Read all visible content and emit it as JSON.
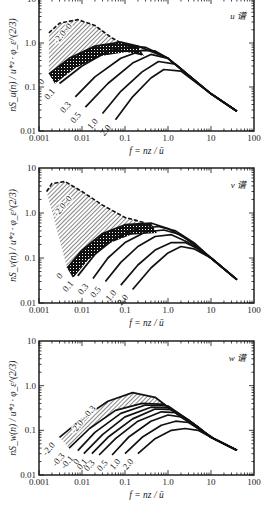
{
  "figure": {
    "x_axis": {
      "label": "f = nz / ū",
      "ticks": [
        "0.001",
        "0.01",
        "0.1",
        "1.0",
        "10",
        "100"
      ],
      "scale": "log",
      "range": [
        0.001,
        100
      ]
    },
    "y_axis": {
      "ticks": [
        "0.01",
        "0.1",
        "1.0",
        "10"
      ],
      "scale": "log",
      "range": [
        0.01,
        10
      ]
    }
  },
  "chart_data": [
    {
      "type": "line",
      "title": "u 谱",
      "xlabel": "f = nz / ū",
      "ylabel": "nS_u(n) / u*² · φ_ε^(2/3)",
      "xlim": [
        0.001,
        100
      ],
      "ylim": [
        0.01,
        10
      ],
      "xscale": "log",
      "yscale": "log",
      "grid": false,
      "annotations": [
        "-2.0~0 (hatched, dashed boundary)",
        "0 (cross-hatched band)"
      ],
      "series": [
        {
          "name": "-2.0~0 upper envelope",
          "style": "dashed",
          "x": [
            0.0017,
            0.003,
            0.008,
            0.02,
            0.05,
            0.1
          ],
          "y": [
            1.7,
            2.8,
            3.4,
            2.5,
            1.3,
            0.9
          ]
        },
        {
          "name": "0",
          "x": [
            0.0017,
            0.005,
            0.02,
            0.08,
            0.2,
            1.0,
            10,
            40
          ],
          "y": [
            0.2,
            0.45,
            0.85,
            1.05,
            0.85,
            0.45,
            0.07,
            0.028
          ]
        },
        {
          "name": "0.1",
          "x": [
            0.003,
            0.01,
            0.04,
            0.15,
            0.3,
            1.0,
            10,
            40
          ],
          "y": [
            0.12,
            0.3,
            0.65,
            0.85,
            0.8,
            0.45,
            0.07,
            0.028
          ]
        },
        {
          "name": "0.3",
          "x": [
            0.007,
            0.02,
            0.08,
            0.25,
            0.5,
            1.0,
            10,
            40
          ],
          "y": [
            0.06,
            0.17,
            0.45,
            0.68,
            0.66,
            0.45,
            0.07,
            0.028
          ]
        },
        {
          "name": "0.5",
          "x": [
            0.012,
            0.04,
            0.15,
            0.4,
            1.0,
            10,
            40
          ],
          "y": [
            0.035,
            0.12,
            0.35,
            0.55,
            0.45,
            0.07,
            0.028
          ]
        },
        {
          "name": "1.0",
          "x": [
            0.03,
            0.08,
            0.25,
            0.6,
            1.5,
            10,
            40
          ],
          "y": [
            0.025,
            0.08,
            0.22,
            0.38,
            0.33,
            0.07,
            0.028
          ]
        },
        {
          "name": "2.0",
          "x": [
            0.06,
            0.15,
            0.4,
            0.8,
            2.0,
            10,
            40
          ],
          "y": [
            0.018,
            0.06,
            0.16,
            0.25,
            0.23,
            0.07,
            0.028
          ]
        }
      ],
      "curve_labels": [
        "-2.0~0",
        "0",
        "0.1",
        "0.3",
        "0.5",
        "1.0",
        "2.0"
      ]
    },
    {
      "type": "line",
      "title": "v 谱",
      "xlabel": "f = nz / ū",
      "ylabel": "nS_v(n) / u*² · φ_ε^(2/3)",
      "xlim": [
        0.001,
        100
      ],
      "ylim": [
        0.01,
        10
      ],
      "xscale": "log",
      "yscale": "log",
      "grid": false,
      "annotations": [
        "-2.0~0 (hatched, dashed boundary)",
        "0 (cross-hatched band)"
      ],
      "series": [
        {
          "name": "-2.0~0 upper envelope",
          "style": "dashed",
          "x": [
            0.0015,
            0.002,
            0.004,
            0.01,
            0.03,
            0.1,
            0.3
          ],
          "y": [
            3.0,
            4.5,
            5.0,
            3.0,
            1.5,
            0.8,
            0.6
          ]
        },
        {
          "name": "0",
          "x": [
            0.0045,
            0.01,
            0.03,
            0.1,
            0.4,
            1.0,
            3.0,
            10,
            40
          ],
          "y": [
            0.06,
            0.15,
            0.35,
            0.55,
            0.6,
            0.45,
            0.25,
            0.1,
            0.033
          ]
        },
        {
          "name": "0.1",
          "x": [
            0.008,
            0.02,
            0.06,
            0.2,
            0.6,
            1.5,
            4.0,
            10,
            40
          ],
          "y": [
            0.04,
            0.12,
            0.28,
            0.45,
            0.5,
            0.4,
            0.22,
            0.1,
            0.033
          ]
        },
        {
          "name": "0.3",
          "x": [
            0.018,
            0.04,
            0.1,
            0.3,
            0.8,
            2.0,
            4.0,
            10,
            40
          ],
          "y": [
            0.035,
            0.1,
            0.22,
            0.38,
            0.42,
            0.33,
            0.2,
            0.1,
            0.033
          ]
        },
        {
          "name": "0.5",
          "x": [
            0.035,
            0.08,
            0.2,
            0.5,
            1.2,
            3.0,
            10,
            40
          ],
          "y": [
            0.03,
            0.08,
            0.18,
            0.3,
            0.33,
            0.22,
            0.1,
            0.033
          ]
        },
        {
          "name": "1.0",
          "x": [
            0.08,
            0.2,
            0.5,
            1.2,
            2.5,
            5.0,
            10,
            40
          ],
          "y": [
            0.025,
            0.07,
            0.15,
            0.22,
            0.22,
            0.16,
            0.1,
            0.033
          ]
        },
        {
          "name": "2.0",
          "x": [
            0.15,
            0.4,
            1.0,
            2.0,
            4.0,
            10,
            40
          ],
          "y": [
            0.02,
            0.06,
            0.13,
            0.18,
            0.16,
            0.1,
            0.033
          ]
        }
      ],
      "curve_labels": [
        "-2.0~0",
        "0",
        "0.1",
        "0.3",
        "0.5",
        "1.0",
        "2.0"
      ]
    },
    {
      "type": "line",
      "title": "w 谱",
      "xlabel": "f = nz / ū",
      "ylabel": "nS_w(n) / u*² · φ_ε^(2/3)",
      "xlim": [
        0.001,
        100
      ],
      "ylim": [
        0.01,
        10
      ],
      "xscale": "log",
      "yscale": "log",
      "grid": false,
      "annotations": [
        "-2.0~-0.3 (hatched band)"
      ],
      "series": [
        {
          "name": "-2.0",
          "x": [
            0.003,
            0.01,
            0.04,
            0.15,
            0.5,
            2.0,
            10,
            40
          ],
          "y": [
            0.07,
            0.18,
            0.45,
            0.7,
            0.55,
            0.2,
            0.07,
            0.036
          ]
        },
        {
          "name": "-0.3",
          "x": [
            0.005,
            0.015,
            0.06,
            0.25,
            0.8,
            3.0,
            10,
            40
          ],
          "y": [
            0.04,
            0.11,
            0.28,
            0.4,
            0.38,
            0.17,
            0.07,
            0.036
          ]
        },
        {
          "name": "-0.1",
          "x": [
            0.008,
            0.02,
            0.08,
            0.3,
            1.0,
            3.0,
            10,
            40
          ],
          "y": [
            0.035,
            0.09,
            0.24,
            0.37,
            0.35,
            0.17,
            0.07,
            0.036
          ]
        },
        {
          "name": "0",
          "x": [
            0.011,
            0.03,
            0.1,
            0.4,
            1.0,
            3.0,
            10,
            40
          ],
          "y": [
            0.03,
            0.08,
            0.2,
            0.33,
            0.32,
            0.16,
            0.07,
            0.036
          ]
        },
        {
          "name": "0.1",
          "x": [
            0.017,
            0.04,
            0.15,
            0.5,
            1.2,
            3.0,
            10,
            40
          ],
          "y": [
            0.03,
            0.07,
            0.18,
            0.3,
            0.29,
            0.16,
            0.07,
            0.036
          ]
        },
        {
          "name": "0.3",
          "x": [
            0.025,
            0.06,
            0.2,
            0.7,
            1.5,
            4.0,
            10,
            40
          ],
          "y": [
            0.028,
            0.065,
            0.16,
            0.26,
            0.25,
            0.14,
            0.07,
            0.036
          ]
        },
        {
          "name": "0.5",
          "x": [
            0.05,
            0.12,
            0.4,
            1.0,
            2.0,
            5.0,
            10,
            40
          ],
          "y": [
            0.028,
            0.07,
            0.16,
            0.22,
            0.2,
            0.12,
            0.07,
            0.036
          ]
        },
        {
          "name": "1.0",
          "x": [
            0.1,
            0.25,
            0.7,
            1.5,
            3.0,
            6.0,
            12,
            40
          ],
          "y": [
            0.03,
            0.07,
            0.13,
            0.16,
            0.15,
            0.1,
            0.065,
            0.036
          ]
        },
        {
          "name": "2.0",
          "x": [
            0.2,
            0.5,
            1.2,
            2.5,
            5.0,
            10,
            40
          ],
          "y": [
            0.03,
            0.065,
            0.1,
            0.11,
            0.1,
            0.07,
            0.036
          ]
        }
      ],
      "curve_labels": [
        "-2.0",
        "-2.0~-0.3",
        "-0.3",
        "-0.1",
        "0",
        "0.1",
        "0.3",
        "0.5",
        "1.0",
        "2.0"
      ]
    }
  ],
  "panels": [
    {
      "corner_label": "u 谱",
      "y_label_sub": "u",
      "top": -1,
      "bottom": 131
    },
    {
      "corner_label": "v 谱",
      "y_label_sub": "v",
      "top": 168,
      "bottom": 303
    },
    {
      "corner_label": "w 谱",
      "y_label_sub": "w",
      "top": 341,
      "bottom": 475
    }
  ]
}
